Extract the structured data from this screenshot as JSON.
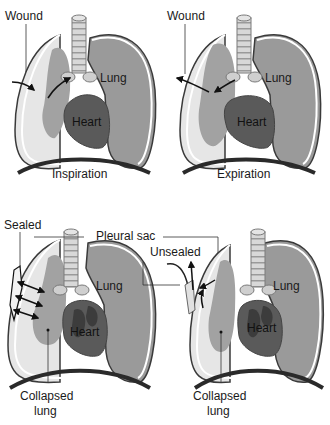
{
  "colors": {
    "background": "#ffffff",
    "lung_fill": "#9a9a9a",
    "collapsed_space": "#e4e4e4",
    "heart_fill": "#5a5a5a",
    "heart_dark": "#3c3c3c",
    "outline": "#3a3a3a",
    "trachea": "#cfcfcf",
    "diaphragm": "#2a2a2a"
  },
  "panels": [
    {
      "id": "top-left",
      "labels": {
        "wound": "Wound",
        "lung": "Lung",
        "heart": "Heart",
        "caption": "Inspiration"
      }
    },
    {
      "id": "top-right",
      "labels": {
        "wound": "Wound",
        "lung": "Lung",
        "heart": "Heart",
        "caption": "Expiration"
      }
    },
    {
      "id": "bottom-left",
      "labels": {
        "sealed": "Sealed",
        "lung": "Lung",
        "heart": "Heart",
        "collapsed_1": "Collapsed",
        "collapsed_2": "lung"
      }
    },
    {
      "id": "bottom-right",
      "labels": {
        "unsealed": "Unsealed",
        "lung": "Lung",
        "heart": "Heart",
        "collapsed_1": "Collapsed",
        "collapsed_2": "lung"
      }
    }
  ],
  "shared_labels": {
    "pleural_sac": "Pleural sac"
  }
}
